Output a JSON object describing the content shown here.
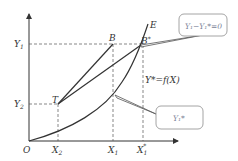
{
  "diagram": {
    "origin_label": "O",
    "y_labels": {
      "y1": "Y",
      "y1_sub": "1",
      "y2": "Y",
      "y2_sub": "2"
    },
    "x_labels": {
      "x2": "X",
      "x2_sub": "2",
      "x1": "X",
      "x1_sub": "1",
      "x1s": "X",
      "x1s_sub": "1",
      "x1s_sup": "*"
    },
    "points": {
      "T": "T",
      "B": "B",
      "Bstar": "B",
      "Bstar_sup": "*",
      "E": "E"
    },
    "curve_label": "Y*=f(X)",
    "callout_top": "Y₁−Y₁*=0",
    "callout_bottom": "Y₁*",
    "colors": {
      "line": "#333333",
      "dash": "#555555",
      "callout_border": "#9a9a9a",
      "callout_text": "#7a7f96"
    }
  }
}
